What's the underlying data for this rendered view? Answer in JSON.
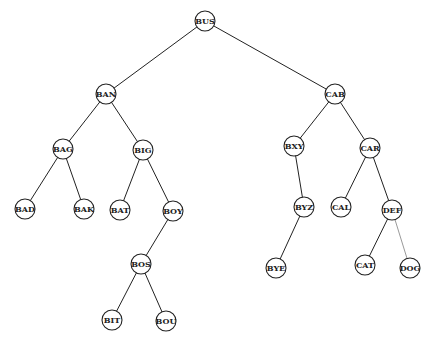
{
  "diagram": {
    "type": "binary-search-tree",
    "nodes": [
      {
        "id": "BUS",
        "label": "BUS"
      },
      {
        "id": "BAN",
        "label": "BAN"
      },
      {
        "id": "CAB",
        "label": "CAB"
      },
      {
        "id": "BAG",
        "label": "BAG"
      },
      {
        "id": "BIG",
        "label": "BIG"
      },
      {
        "id": "BXY",
        "label": "BXY"
      },
      {
        "id": "CAR",
        "label": "CAR"
      },
      {
        "id": "BAD",
        "label": "BAD"
      },
      {
        "id": "BAK",
        "label": "BAK"
      },
      {
        "id": "BAT",
        "label": "BAT"
      },
      {
        "id": "BOY",
        "label": "BOY"
      },
      {
        "id": "BYZ",
        "label": "BYZ"
      },
      {
        "id": "CAL",
        "label": "CAL"
      },
      {
        "id": "DEF",
        "label": "DEF"
      },
      {
        "id": "BOS",
        "label": "BOS"
      },
      {
        "id": "BYE",
        "label": "BYE"
      },
      {
        "id": "CAT",
        "label": "CAT"
      },
      {
        "id": "DOG",
        "label": "DOG"
      },
      {
        "id": "BIT",
        "label": "BIT"
      },
      {
        "id": "BOU",
        "label": "BOU"
      }
    ],
    "edges": [
      {
        "from": "BUS",
        "to": "BAN"
      },
      {
        "from": "BUS",
        "to": "CAB"
      },
      {
        "from": "BAN",
        "to": "BAG"
      },
      {
        "from": "BAN",
        "to": "BIG"
      },
      {
        "from": "BAG",
        "to": "BAD"
      },
      {
        "from": "BAG",
        "to": "BAK"
      },
      {
        "from": "BIG",
        "to": "BAT"
      },
      {
        "from": "BIG",
        "to": "BOY"
      },
      {
        "from": "BOY",
        "to": "BOS"
      },
      {
        "from": "BOS",
        "to": "BIT"
      },
      {
        "from": "BOS",
        "to": "BOU"
      },
      {
        "from": "CAB",
        "to": "BXY"
      },
      {
        "from": "CAB",
        "to": "CAR"
      },
      {
        "from": "BXY",
        "to": "BYZ"
      },
      {
        "from": "BYZ",
        "to": "BYE"
      },
      {
        "from": "CAR",
        "to": "CAL"
      },
      {
        "from": "CAR",
        "to": "DEF"
      },
      {
        "from": "DEF",
        "to": "CAT"
      },
      {
        "from": "DEF",
        "to": "DOG",
        "style": "faint"
      }
    ]
  }
}
